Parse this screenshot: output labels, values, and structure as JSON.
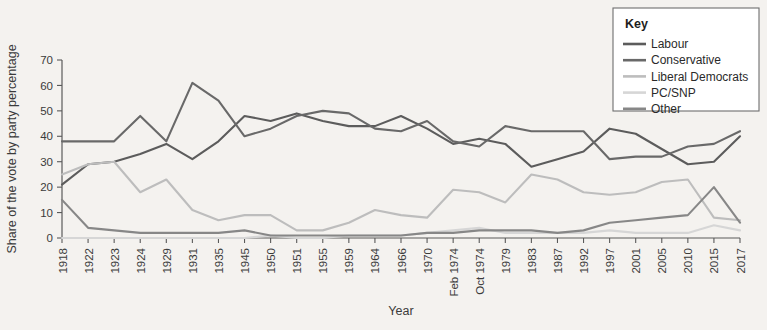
{
  "chart_data": {
    "type": "line",
    "title": "",
    "xlabel": "Year",
    "ylabel": "Share of the vote by party percentage",
    "ylim": [
      0,
      70
    ],
    "yticks": [
      0,
      10,
      20,
      30,
      40,
      50,
      60,
      70
    ],
    "grid": false,
    "legend_position": "top-right",
    "legend_title": "Key",
    "categories": [
      "1918",
      "1922",
      "1923",
      "1924",
      "1929",
      "1931",
      "1935",
      "1945",
      "1950",
      "1951",
      "1955",
      "1959",
      "1964",
      "1966",
      "1970",
      "Feb 1974",
      "Oct 1974",
      "1979",
      "1983",
      "1987",
      "1992",
      "1997",
      "2001",
      "2005",
      "2010",
      "2015",
      "2017"
    ],
    "series": [
      {
        "name": "Labour",
        "color": "#5c5c5c",
        "values": [
          21,
          29,
          30,
          33,
          37,
          31,
          38,
          48,
          46,
          49,
          46,
          44,
          44,
          48,
          43,
          37,
          39,
          37,
          28,
          31,
          34,
          43,
          41,
          35,
          29,
          30,
          40
        ]
      },
      {
        "name": "Conservative",
        "color": "#696969",
        "values": [
          38,
          38,
          38,
          48,
          38,
          61,
          54,
          40,
          43,
          48,
          50,
          49,
          43,
          42,
          46,
          38,
          36,
          44,
          42,
          42,
          42,
          31,
          32,
          32,
          36,
          37,
          42
        ]
      },
      {
        "name": "Liberal Democrats",
        "color": "#bdbdbd",
        "values": [
          25,
          29,
          30,
          18,
          23,
          11,
          7,
          9,
          9,
          3,
          3,
          6,
          11,
          9,
          8,
          19,
          18,
          14,
          25,
          23,
          18,
          17,
          18,
          22,
          23,
          8,
          7
        ]
      },
      {
        "name": "PC/SNP",
        "color": "#d6d6d6",
        "values": [
          0,
          0,
          0,
          0,
          0,
          0,
          0,
          0,
          1,
          0,
          0,
          1,
          1,
          1,
          2,
          3,
          4,
          2,
          2,
          2,
          2,
          3,
          2,
          2,
          2,
          5,
          3
        ]
      },
      {
        "name": "Other",
        "color": "#878787",
        "values": [
          15,
          4,
          3,
          2,
          2,
          2,
          2,
          3,
          1,
          1,
          1,
          1,
          1,
          1,
          2,
          2,
          3,
          3,
          3,
          2,
          3,
          6,
          7,
          8,
          9,
          20,
          6
        ]
      }
    ]
  },
  "legend": {
    "title": "Key",
    "items": [
      {
        "label": "Labour",
        "color": "#5c5c5c"
      },
      {
        "label": "Conservative",
        "color": "#696969"
      },
      {
        "label": "Liberal Democrats",
        "color": "#bdbdbd"
      },
      {
        "label": "PC/SNP",
        "color": "#d6d6d6"
      },
      {
        "label": "Other",
        "color": "#878787"
      }
    ]
  },
  "axes": {
    "x_title": "Year",
    "y_title": "Share of the vote by party percentage"
  },
  "theme": {
    "background": "#f4f2ef",
    "axis_color": "#5a5a5a",
    "text_color": "#3b3b3b",
    "legend_border": "#6e6e6e",
    "legend_background": "#ffffff"
  }
}
